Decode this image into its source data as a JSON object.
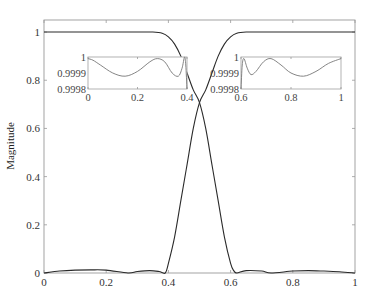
{
  "chart_data": [
    {
      "id": "main",
      "type": "line",
      "title": "",
      "xlabel": "",
      "ylabel": "Magnitude",
      "xlim": [
        0,
        1
      ],
      "ylim": [
        0,
        1.05
      ],
      "grid": false,
      "legend": null,
      "x_ticks": [
        0,
        0.2,
        0.4,
        0.6,
        0.8,
        1
      ],
      "x_tick_labels": [
        "0",
        "0.2",
        "0.4",
        "0.6",
        "0.8",
        "1"
      ],
      "y_ticks": [
        0,
        0.2,
        0.4,
        0.6,
        0.8,
        1
      ],
      "y_tick_labels": [
        "0",
        "0.2",
        "0.4",
        "0.6",
        "0.8",
        "1"
      ],
      "series": [
        {
          "name": "lowpass",
          "x": [
            0,
            0.05,
            0.1,
            0.15,
            0.2,
            0.25,
            0.3,
            0.35,
            0.38,
            0.4,
            0.42,
            0.44,
            0.46,
            0.48,
            0.5,
            0.52,
            0.54,
            0.56,
            0.58,
            0.6,
            0.61,
            0.62,
            0.65,
            0.7,
            0.73,
            0.8,
            0.85,
            0.9,
            0.95,
            1
          ],
          "y": [
            1,
            1,
            1,
            1,
            1,
            1,
            1,
            1,
            0.995,
            0.98,
            0.95,
            0.9,
            0.83,
            0.76,
            0.707,
            0.6,
            0.45,
            0.3,
            0.15,
            0.04,
            0.01,
            0.0,
            0.01,
            0.008,
            0.0,
            0.008,
            0.01,
            0.008,
            0.005,
            0.0
          ]
        },
        {
          "name": "highpass",
          "x": [
            0,
            0.05,
            0.1,
            0.15,
            0.2,
            0.27,
            0.3,
            0.34,
            0.37,
            0.39,
            0.4,
            0.42,
            0.44,
            0.46,
            0.48,
            0.5,
            0.52,
            0.54,
            0.56,
            0.58,
            0.6,
            0.62,
            0.65,
            0.7,
            0.75,
            0.8,
            0.85,
            0.9,
            0.95,
            1
          ],
          "y": [
            0.0,
            0.008,
            0.012,
            0.013,
            0.012,
            0.0,
            0.006,
            0.01,
            0.006,
            0.0,
            0.04,
            0.15,
            0.3,
            0.45,
            0.6,
            0.707,
            0.76,
            0.83,
            0.9,
            0.95,
            0.98,
            0.995,
            1,
            1,
            1,
            1,
            1,
            1,
            1,
            1
          ]
        }
      ]
    },
    {
      "id": "inset_left",
      "type": "line",
      "title": "",
      "xlim": [
        0,
        0.4
      ],
      "ylim": [
        0.9998,
        1
      ],
      "x_tick_labels": [
        "0",
        "0.2",
        "0.4"
      ],
      "y_tick_labels": [
        "1",
        "0.9999",
        "0.9998"
      ],
      "series": [
        {
          "name": "lowpass passband zoom",
          "x": [
            0,
            0.02,
            0.05,
            0.1,
            0.15,
            0.2,
            0.25,
            0.28,
            0.31,
            0.34,
            0.365,
            0.38,
            0.39,
            0.395,
            0.4
          ],
          "y": [
            0.99999,
            0.99998,
            0.99995,
            0.9999,
            0.99988,
            0.99991,
            0.99997,
            0.99999,
            0.99997,
            0.9999,
            0.99988,
            0.99993,
            1.0,
            0.99995,
            0.9998
          ]
        }
      ]
    },
    {
      "id": "inset_right",
      "type": "line",
      "title": "",
      "xlim": [
        0.6,
        1
      ],
      "ylim": [
        0.9998,
        1
      ],
      "x_tick_labels": [
        "0.6",
        "0.8",
        "1"
      ],
      "y_tick_labels": [
        "1",
        "0.9999",
        "0.9998"
      ],
      "series": [
        {
          "name": "highpass passband zoom",
          "x": [
            0.6,
            0.605,
            0.612,
            0.625,
            0.64,
            0.66,
            0.69,
            0.72,
            0.76,
            0.8,
            0.85,
            0.9,
            0.95,
            1
          ],
          "y": [
            0.9998,
            0.99995,
            0.99999,
            0.99993,
            0.99989,
            0.99991,
            0.99997,
            0.99999,
            0.99995,
            0.9999,
            0.99988,
            0.99991,
            0.99996,
            0.99999
          ]
        }
      ]
    }
  ]
}
